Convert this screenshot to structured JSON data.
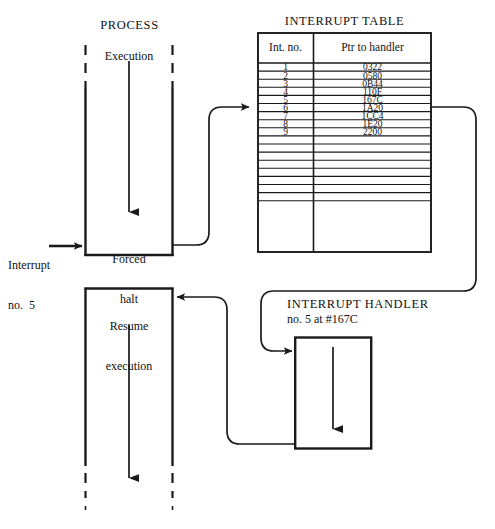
{
  "diagram": {
    "title_process": "PROCESS",
    "title_interrupt_table": "INTERRUPT TABLE",
    "title_interrupt_handler": "INTERRUPT HANDLER",
    "handler_subtitle": "no. 5 at #167C",
    "label_execution": "Execution",
    "label_forced_halt_line1": "Forced",
    "label_forced_halt_line2": "halt",
    "label_resume_line1": "Resume",
    "label_resume_line2": "execution",
    "label_interrupt_line1": "Interrupt",
    "label_interrupt_line2": "no.  5",
    "stroke_color": "#1a1a1a",
    "background_color": "#ffffff"
  },
  "interrupt_table": {
    "headers": [
      "Int. no.",
      "Ptr to handler"
    ],
    "rows": [
      {
        "int_no": "1",
        "ptr": "0322"
      },
      {
        "int_no": "2",
        "ptr": "0580"
      },
      {
        "int_no": "3",
        "ptr": "0B44"
      },
      {
        "int_no": "4",
        "ptr": "110F"
      },
      {
        "int_no": "5",
        "ptr": "167C"
      },
      {
        "int_no": "6",
        "ptr": "1A20"
      },
      {
        "int_no": "7",
        "ptr": "1CC4"
      },
      {
        "int_no": "8",
        "ptr": "1E20"
      },
      {
        "int_no": "9",
        "ptr": "2200"
      },
      {
        "int_no": "",
        "ptr": ""
      },
      {
        "int_no": "",
        "ptr": ""
      },
      {
        "int_no": "",
        "ptr": ""
      },
      {
        "int_no": "",
        "ptr": ""
      },
      {
        "int_no": "",
        "ptr": ""
      },
      {
        "int_no": "",
        "ptr": ""
      },
      {
        "int_no": "",
        "ptr": ""
      }
    ],
    "selected_row_index": 4
  },
  "chart_data": {
    "type": "table",
    "title": "INTERRUPT TABLE",
    "columns": [
      "Int. no.",
      "Ptr to handler"
    ],
    "rows": [
      [
        "1",
        "0322"
      ],
      [
        "2",
        "0580"
      ],
      [
        "3",
        "0B44"
      ],
      [
        "4",
        "110F"
      ],
      [
        "5",
        "167C"
      ],
      [
        "6",
        "1A20"
      ],
      [
        "7",
        "1CC4"
      ],
      [
        "8",
        "1E20"
      ],
      [
        "9",
        "2200"
      ]
    ]
  }
}
